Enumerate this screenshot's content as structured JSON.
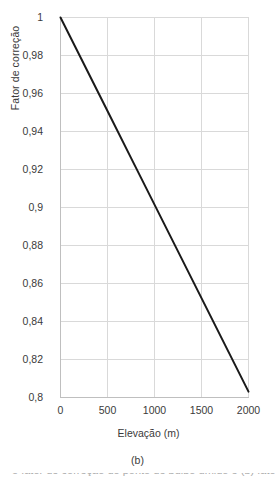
{
  "chart_data": {
    "type": "line",
    "title": "",
    "subtitle": "",
    "xlabel": "Elevação (m)",
    "ylabel": "Fator de correção",
    "caption": "(b)",
    "xlim": [
      0,
      2000
    ],
    "ylim": [
      0.8,
      1.0
    ],
    "xticks": [
      0,
      500,
      1000,
      1500,
      2000
    ],
    "yticks": [
      0.8,
      0.82,
      0.84,
      0.86,
      0.88,
      0.9,
      0.92,
      0.94,
      0.96,
      0.98,
      1.0
    ],
    "xtick_labels": [
      "0",
      "500",
      "1000",
      "1500",
      "2000"
    ],
    "ytick_labels": [
      "0,8",
      "0,82",
      "0,84",
      "0,86",
      "0,88",
      "0,9",
      "0,92",
      "0,94",
      "0,96",
      "0,98",
      "1"
    ],
    "grid": true,
    "grid_x": true,
    "grid_y": true,
    "legend": false,
    "legend_position": "none",
    "decimal_separator": ",",
    "series": [
      {
        "name": "Fator de correção",
        "color": "#1a1a1a",
        "line_width": 2,
        "x": [
          0,
          250,
          500,
          750,
          1000,
          1250,
          1500,
          1750,
          2000
        ],
        "values": [
          1.0,
          0.9754,
          0.9508,
          0.9261,
          0.9015,
          0.8769,
          0.8523,
          0.8277,
          0.8031
        ]
      }
    ],
    "colors": {
      "line": "#1a1a1a",
      "grid": "#d9d9d9",
      "axis": "#bfbfbf",
      "text": "#3a3a3a",
      "background": "#ffffff"
    },
    "annotations": []
  },
  "figure": {
    "cutoff_line": "o fator de correção do ponto de bulbo úmido e (b) fator de correção"
  }
}
